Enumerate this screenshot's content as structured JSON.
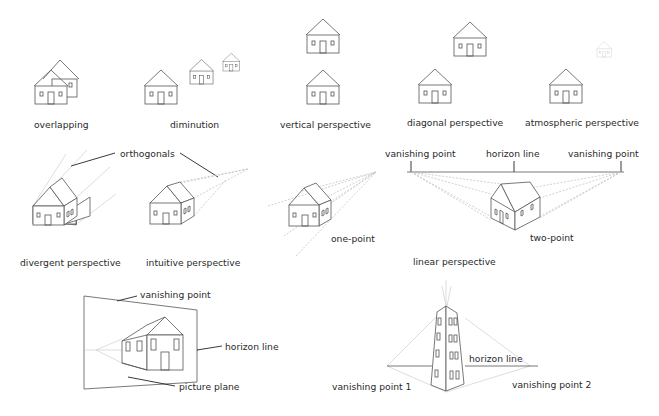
{
  "figure": {
    "panels": [
      {
        "id": "overlapping",
        "caption": "overlapping"
      },
      {
        "id": "diminution",
        "caption": "diminution"
      },
      {
        "id": "vertical",
        "caption": "vertical perspective"
      },
      {
        "id": "diagonal",
        "caption": "diagonal perspective"
      },
      {
        "id": "atmospheric",
        "caption": "atmospheric perspective"
      },
      {
        "id": "divergent",
        "caption": "divergent perspective"
      },
      {
        "id": "intuitive",
        "caption": "intuitive perspective"
      },
      {
        "id": "one_point",
        "caption": "one-point"
      },
      {
        "id": "two_point",
        "caption": "two-point"
      },
      {
        "id": "linear",
        "caption": "linear perspective"
      }
    ],
    "callouts": {
      "orthogonals": "orthogonals",
      "vanishing_point_left": "vanishing point",
      "horizon_line": "horizon line",
      "vanishing_point_right": "vanishing point"
    },
    "picture_plane_diagram": {
      "vanishing_point": "vanishing point",
      "horizon_line": "horizon line",
      "picture_plane": "picture plane"
    },
    "three_point_diagram": {
      "horizon_line": "horizon line",
      "vanishing_point_1": "vanishing point 1",
      "vanishing_point_2": "vanishing point 2"
    }
  }
}
